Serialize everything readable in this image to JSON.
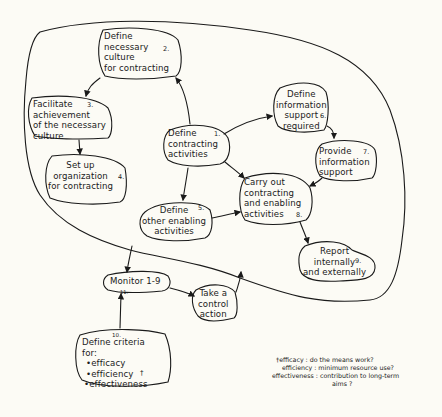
{
  "diagram": {
    "type": "process-cycle",
    "stroke_color": "#1a1a1a",
    "background_color": "#fcfbf5",
    "nodes": [
      {
        "id": "1",
        "number": "1.",
        "lines": [
          "Define",
          "contracting",
          "activities"
        ]
      },
      {
        "id": "2",
        "number": "2.",
        "lines": [
          "Define",
          "necessary",
          "culture",
          "for contracting"
        ]
      },
      {
        "id": "3",
        "number": "3.",
        "lines": [
          "Facilitate",
          "achievement",
          "of the necessary",
          "culture"
        ]
      },
      {
        "id": "4",
        "number": "4.",
        "lines": [
          "Set up",
          "organization",
          "for contracting"
        ]
      },
      {
        "id": "5",
        "number": "5.",
        "lines": [
          "Define",
          "other enabling",
          "activities"
        ]
      },
      {
        "id": "6",
        "number": "6.",
        "lines": [
          "Define",
          "information",
          "support",
          "required"
        ]
      },
      {
        "id": "7",
        "number": "7.",
        "lines": [
          "Provide",
          "information",
          "support"
        ]
      },
      {
        "id": "8",
        "number": "8.",
        "lines": [
          "Carry out",
          "contracting",
          "and enabling",
          "activities"
        ]
      },
      {
        "id": "9",
        "number": "9.",
        "lines": [
          "Report",
          "internally",
          "and externally"
        ]
      },
      {
        "id": "11",
        "number": "11.",
        "lines": [
          "Monitor 1-9"
        ]
      },
      {
        "id": "12",
        "number": "",
        "lines": [
          "Take a",
          "control",
          "action"
        ]
      },
      {
        "id": "10",
        "number": "10.",
        "lines": [
          "Define criteria",
          "for:",
          "•efficacy",
          "•efficiency",
          "•effectiveness"
        ],
        "footnote_mark": "†"
      }
    ],
    "edges": [
      {
        "from": "1",
        "to": "2"
      },
      {
        "from": "2",
        "to": "3"
      },
      {
        "from": "3",
        "to": "4"
      },
      {
        "from": "1",
        "to": "5"
      },
      {
        "from": "1",
        "to": "6"
      },
      {
        "from": "6",
        "to": "7"
      },
      {
        "from": "7",
        "to": "8"
      },
      {
        "from": "1",
        "to": "8"
      },
      {
        "from": "5",
        "to": "8"
      },
      {
        "from": "8",
        "to": "9"
      },
      {
        "from": "boundary",
        "to": "11"
      },
      {
        "from": "11",
        "to": "12"
      },
      {
        "from": "12",
        "to": "boundary"
      },
      {
        "from": "10",
        "to": "11"
      }
    ],
    "legend": {
      "mark": "†",
      "lines": [
        "†efficacy : do the means work?",
        "efficiency : minimum resource use?",
        "effectiveness : contribution to long-term",
        "aims ?"
      ]
    }
  }
}
